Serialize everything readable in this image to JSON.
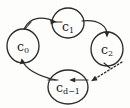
{
  "figure": {
    "type": "directed-cycle-diagram",
    "background_color": "#fdfdfb",
    "stroke_color": "#2b2b2b",
    "nodes": [
      {
        "id": "c0",
        "name": "node-c0",
        "label_base": "c",
        "label_sub": "0",
        "label_full": "c0",
        "cx": 23,
        "cy": 46,
        "rx": 16,
        "ry": 17
      },
      {
        "id": "c1",
        "name": "node-c1",
        "label_base": "c",
        "label_sub": "1",
        "label_full": "c1",
        "cx": 68,
        "cy": 23,
        "rx": 16,
        "ry": 15
      },
      {
        "id": "c2",
        "name": "node-c2",
        "label_base": "c",
        "label_sub": "2",
        "label_full": "c2",
        "cx": 107,
        "cy": 49,
        "rx": 16,
        "ry": 17
      },
      {
        "id": "cd1",
        "name": "node-cd-minus-1",
        "label_base": "c",
        "label_sub": "d−1",
        "label_full": "cd−1",
        "cx": 68,
        "cy": 87,
        "rx": 20,
        "ry": 17
      }
    ],
    "edges": [
      {
        "id": "e0",
        "name": "edge-c0-to-c1",
        "from": "c0",
        "to": "c1",
        "style": "solid",
        "arrow_direction": "right"
      },
      {
        "id": "e1",
        "name": "edge-c1-to-c2",
        "from": "c1",
        "to": "c2",
        "style": "solid",
        "arrow_direction": "down"
      },
      {
        "id": "e2",
        "name": "edge-c2-to-cd-minus-1",
        "from": "c2",
        "to": "cd1",
        "style": "dotted",
        "arrow_direction": "down-left"
      },
      {
        "id": "e3",
        "name": "edge-cd-minus-1-to-c0",
        "from": "cd1",
        "to": "c0",
        "style": "solid",
        "arrow_direction": "up-left"
      },
      {
        "id": "e4",
        "name": "edge-inner-cd-minus-1",
        "from": "cd1",
        "to": "cd1",
        "style": "solid",
        "arrow_direction": "left"
      }
    ]
  }
}
